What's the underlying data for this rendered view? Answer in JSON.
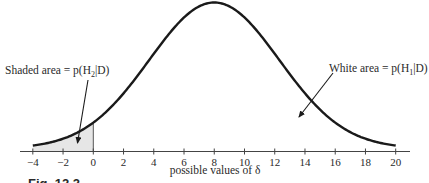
{
  "chart_data": {
    "type": "area",
    "title": "",
    "caption": "Fig. 12.2",
    "xlabel": "possible values of δ",
    "ylabel": "",
    "xlim": [
      -4,
      20
    ],
    "x_ticks": [
      -4,
      -2,
      0,
      2,
      4,
      6,
      8,
      10,
      12,
      14,
      16,
      18,
      20
    ],
    "x_tick_labels": [
      "−4",
      "−2",
      "0",
      "2",
      "4",
      "6",
      "8",
      "10",
      "12",
      "14",
      "16",
      "18",
      "20"
    ],
    "grid": false,
    "legend": null,
    "series": [
      {
        "name": "posterior density of δ",
        "distribution": "normal",
        "mean": 8,
        "sd": 4.3,
        "color": "#1a1a1a"
      }
    ],
    "shaded_region": {
      "from": -4,
      "to": 0,
      "fill": "#e6e6e6"
    },
    "annotations": [
      {
        "text": "Shaded area = p(H₂|D)",
        "points_to": "shaded region",
        "x_value": -1.1
      },
      {
        "text": "White area = p(H₁|D)",
        "points_to": "unshaded region",
        "x_value": 13.8
      }
    ]
  },
  "labels": {
    "shaded": "Shaded area = p(H",
    "shaded_sub": "2",
    "shaded_tail": "|D)",
    "white": "White area = p(H",
    "white_sub": "1",
    "white_tail": "|D)",
    "xlabel": "possible values of δ",
    "caption": "Fig. 12.2"
  }
}
